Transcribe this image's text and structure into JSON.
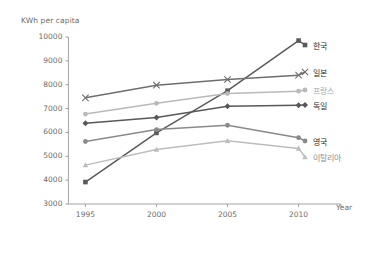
{
  "chart_data": {
    "type": "line",
    "title": "",
    "subtitle": "",
    "xlabel": "Year",
    "ylabel": "KWh per capita",
    "x": [
      1995,
      2000,
      2005,
      2010
    ],
    "xtick_labels": [
      "1995",
      "2000",
      "2005",
      "2010"
    ],
    "ytick_labels": [
      "3000",
      "4000",
      "5000",
      "6000",
      "7000",
      "8000",
      "9000",
      "10000"
    ],
    "yticks": [
      3000,
      4000,
      5000,
      6000,
      7000,
      8000,
      9000,
      10000
    ],
    "xlim": [
      1993,
      2012
    ],
    "ylim": [
      3000,
      10000
    ],
    "grid": false,
    "legend_position": "right",
    "series": [
      {
        "name": "한국",
        "values": [
          3920,
          5980,
          7750,
          9850
        ],
        "color": "#5a5a5a",
        "marker": "square",
        "label_color": "#2b2b2b"
      },
      {
        "name": "일본",
        "values": [
          7450,
          7980,
          8220,
          8400
        ],
        "color": "#6e6e6e",
        "marker": "x",
        "label_color": "#2b2b2b"
      },
      {
        "name": "프랑스",
        "values": [
          6770,
          7220,
          7630,
          7730
        ],
        "color": "#b9b9b9",
        "marker": "circle",
        "label_color": "#a8a8a8"
      },
      {
        "name": "독일",
        "values": [
          6380,
          6630,
          7100,
          7140
        ],
        "color": "#585858",
        "marker": "diamond",
        "label_color": "#2b2b2b"
      },
      {
        "name": "영국",
        "values": [
          5620,
          6120,
          6300,
          5780
        ],
        "color": "#8a8a8a",
        "marker": "circle",
        "label_color": "#2b2b2b"
      },
      {
        "name": "이탈리아",
        "values": [
          4630,
          5280,
          5650,
          5330
        ],
        "color": "#bdbdbd",
        "marker": "triangle",
        "label_color": "#8f8f8f"
      }
    ],
    "axis_color": "#9a9a9a",
    "text_color": "#6b6b6b"
  }
}
